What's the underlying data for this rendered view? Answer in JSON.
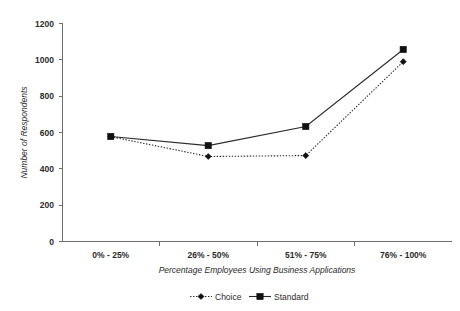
{
  "chart_data": {
    "type": "line",
    "title": "",
    "subtitle": "",
    "categories": [
      "0% - 25%",
      "26% - 50%",
      "51% - 75%",
      "76% - 100%"
    ],
    "series": [
      {
        "name": "Choice",
        "values": [
          577,
          468,
          473,
          990
        ],
        "style": "dotted",
        "marker": "diamond",
        "color": "#111111"
      },
      {
        "name": "Standard",
        "values": [
          578,
          528,
          633,
          1057
        ],
        "style": "solid",
        "marker": "square",
        "color": "#111111"
      }
    ],
    "xlabel": "Percentage Employees Using Business Applications",
    "ylabel": "Number of Respondents",
    "ylim": [
      0,
      1200
    ],
    "ytick_step": 200,
    "yticks": [
      "0",
      "200",
      "400",
      "600",
      "800",
      "1000",
      "1200"
    ],
    "grid": false,
    "legend_position": "bottom"
  },
  "legend": {
    "entries": [
      {
        "label": "Choice",
        "style": "dotted",
        "marker": "diamond"
      },
      {
        "label": "Standard",
        "style": "solid",
        "marker": "square"
      }
    ]
  }
}
